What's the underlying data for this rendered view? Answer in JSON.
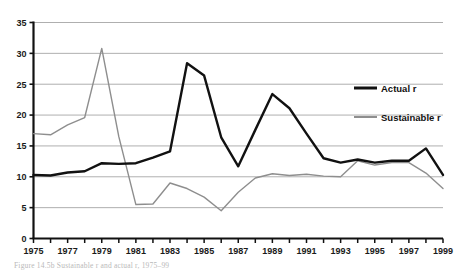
{
  "chart_data": {
    "type": "line",
    "title": "",
    "xlabel": "",
    "ylabel": "",
    "xlim": [
      1975,
      1999
    ],
    "ylim": [
      0,
      35
    ],
    "ytick_step": 5,
    "yticks": [
      0,
      5,
      10,
      15,
      20,
      25,
      30,
      35
    ],
    "ytick_labels": [
      "0",
      "5",
      "10",
      "15",
      "20",
      "25",
      "30",
      "35"
    ],
    "x": [
      1975,
      1976,
      1977,
      1978,
      1979,
      1980,
      1981,
      1982,
      1983,
      1984,
      1985,
      1986,
      1987,
      1988,
      1989,
      1990,
      1991,
      1992,
      1993,
      1994,
      1995,
      1996,
      1997,
      1998,
      1999
    ],
    "xticks": [
      1975,
      1976,
      1977,
      1978,
      1979,
      1980,
      1981,
      1982,
      1983,
      1984,
      1985,
      1986,
      1987,
      1988,
      1989,
      1990,
      1991,
      1992,
      1993,
      1994,
      1995,
      1996,
      1997,
      1998,
      1999
    ],
    "xtick_labels": [
      "1975",
      "",
      "1977",
      "",
      "1979",
      "",
      "1981",
      "",
      "1983",
      "",
      "1985",
      "",
      "1987",
      "",
      "1989",
      "",
      "1991",
      "",
      "1993",
      "",
      "1995",
      "",
      "1997",
      "",
      "1999"
    ],
    "grid": "horizontal",
    "legend_position": "right-inside",
    "series": [
      {
        "name": "Actual r",
        "color": "#111111",
        "width": 2.4,
        "values": [
          10.3,
          10.2,
          10.7,
          10.9,
          12.2,
          12.1,
          12.2,
          13.1,
          14.1,
          28.4,
          26.4,
          16.4,
          11.7,
          17.6,
          23.4,
          21.1,
          17.0,
          13.0,
          12.3,
          12.8,
          12.3,
          12.6,
          12.6,
          14.6,
          10.3
        ]
      },
      {
        "name": "Sustainable r",
        "color": "#8e8e8e",
        "width": 1.4,
        "values": [
          17.0,
          16.8,
          18.4,
          19.6,
          30.8,
          16.5,
          5.5,
          5.6,
          9.0,
          8.1,
          6.7,
          4.5,
          7.5,
          9.8,
          10.5,
          10.2,
          10.4,
          10.1,
          10.0,
          12.6,
          11.9,
          12.3,
          12.3,
          10.6,
          8.1
        ]
      }
    ]
  },
  "legend": {
    "entries": [
      {
        "label": "Actual r",
        "swatch": "line-swatch-black"
      },
      {
        "label": "Sustainable r",
        "swatch": "line-swatch-gray"
      }
    ]
  },
  "caption": {
    "text": "Figure 14.5b Sustainable r and actual r, 1975–99"
  }
}
